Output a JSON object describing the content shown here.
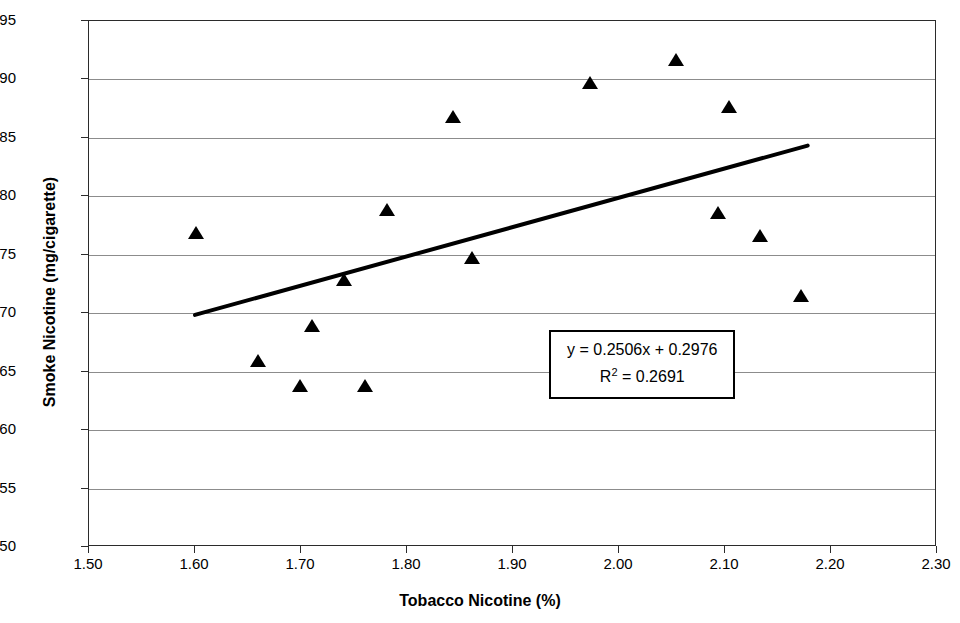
{
  "chart_data": {
    "type": "scatter",
    "title": "",
    "xlabel": "Tobacco Nicotine (%)",
    "ylabel": "Smoke Nicotine (mg/cigarette)",
    "xlim": [
      1.5,
      2.3
    ],
    "ylim": [
      0.5,
      0.95
    ],
    "xticks": [
      "1.50",
      "1.60",
      "1.70",
      "1.80",
      "1.90",
      "2.00",
      "2.10",
      "2.20",
      "2.30"
    ],
    "xtick_values": [
      1.5,
      1.6,
      1.7,
      1.8,
      1.9,
      2.0,
      2.1,
      2.2,
      2.3
    ],
    "yticks": [
      "0.50",
      "0.55",
      "0.60",
      "0.65",
      "0.70",
      "0.75",
      "0.80",
      "0.85",
      "0.90",
      "0.95"
    ],
    "ytick_values": [
      0.5,
      0.55,
      0.6,
      0.65,
      0.7,
      0.75,
      0.8,
      0.85,
      0.9,
      0.95
    ],
    "grid": "horizontal",
    "legend": "none",
    "marker": "triangle-up",
    "marker_color": "#000000",
    "points": [
      {
        "x": 1.601,
        "y": 0.769
      },
      {
        "x": 1.659,
        "y": 0.659
      },
      {
        "x": 1.699,
        "y": 0.638
      },
      {
        "x": 1.71,
        "y": 0.689
      },
      {
        "x": 1.741,
        "y": 0.728
      },
      {
        "x": 1.76,
        "y": 0.638
      },
      {
        "x": 1.781,
        "y": 0.788
      },
      {
        "x": 1.843,
        "y": 0.868
      },
      {
        "x": 1.861,
        "y": 0.747
      },
      {
        "x": 1.973,
        "y": 0.897
      },
      {
        "x": 2.054,
        "y": 0.917
      },
      {
        "x": 2.093,
        "y": 0.786
      },
      {
        "x": 2.104,
        "y": 0.876
      },
      {
        "x": 2.133,
        "y": 0.766
      },
      {
        "x": 2.172,
        "y": 0.715
      }
    ],
    "trendline": {
      "slope": 0.2506,
      "intercept": 0.2976,
      "r_squared": 0.2691,
      "x_start": 1.6,
      "x_end": 2.178,
      "color": "#000000"
    },
    "annotation": {
      "equation": "y = 0.2506x + 0.2976",
      "r_prefix": "R",
      "r_exponent": "2",
      "r_value": " = 0.2691"
    }
  }
}
